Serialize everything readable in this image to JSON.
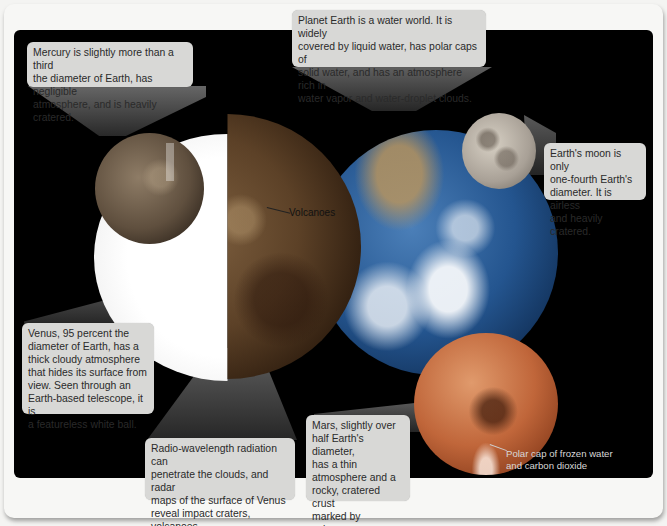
{
  "figure": {
    "colors": {
      "frame": "#f7f7f5",
      "panel": "#000000",
      "callout_bg": "#d8d8d6",
      "callout_text": "#2a2a2a",
      "mars": "#c0663a",
      "earth": "#24558f",
      "venus_radar": "#5c4127",
      "moon": "#a8a096",
      "mercury": "#5f4f3e"
    },
    "planets": [
      {
        "name": "Mercury"
      },
      {
        "name": "Venus"
      },
      {
        "name": "Earth"
      },
      {
        "name": "Moon"
      },
      {
        "name": "Mars"
      }
    ]
  },
  "callouts": {
    "mercury": "Mercury is slightly more than a third\nthe diameter of Earth, has negligible\natmosphere, and is heavily cratered.",
    "earth": "Planet Earth is a water world. It is widely\ncovered by liquid water, has polar caps of\nsolid water, and has an atmosphere rich in\nwater vapor and water-droplet clouds.",
    "moon": "Earth's moon is only\none-fourth Earth's\ndiameter. It is airless\nand heavily cratered.",
    "venus": "Venus, 95 percent the\ndiameter of Earth, has a\nthick cloudy atmosphere\nthat hides its surface from\nview. Seen through an\nEarth-based telescope, it is\na featureless white ball.",
    "radio": "Radio-wavelength radiation can\npenetrate the clouds, and radar\nmaps of the surface of Venus\nreveal impact craters, volcanoes,\nand solidified lava flows.",
    "mars": "Mars, slightly over\nhalf Earth's diameter,\nhas a thin\natmosphere and a\nrocky, cratered crust\nmarked by volcanoes\nand old lava flows."
  },
  "labels": {
    "volcanoes": "Volcanoes",
    "polar_cap": "Polar cap of frozen water\nand carbon dioxide"
  }
}
